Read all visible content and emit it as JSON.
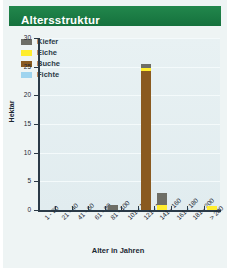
{
  "header": {
    "title": "Altersstruktur"
  },
  "chart_data": {
    "type": "bar",
    "stacked": true,
    "title": "Altersstruktur",
    "xlabel": "Alter in Jahren",
    "ylabel": "Hektar",
    "ylim": [
      0,
      30
    ],
    "yticks": [
      0,
      5,
      10,
      15,
      20,
      25,
      30
    ],
    "grid": true,
    "legend_position": "top-left",
    "categories": [
      "1 - 20",
      "21 - 40",
      "41 - 60",
      "61 - 80",
      "81 - 100",
      "101 - 120",
      "121 - 140",
      "141 - 160",
      "161 - 180",
      "181 - 200",
      "> 200"
    ],
    "series": [
      {
        "name": "Kiefer",
        "color": "#6e6e66",
        "values": [
          0,
          0,
          0,
          0,
          0.9,
          0,
          0.7,
          2.0,
          0,
          0,
          0
        ]
      },
      {
        "name": "Eiche",
        "color": "#ffed2e",
        "values": [
          0,
          0,
          0,
          0,
          0,
          0,
          0.5,
          0.9,
          0,
          0,
          0.7
        ]
      },
      {
        "name": "Buche",
        "color": "#8a5a20",
        "values": [
          0,
          0,
          0,
          0,
          0,
          0,
          24.3,
          0,
          0,
          0,
          0
        ]
      },
      {
        "name": "Fichte",
        "color": "#9fd4ef",
        "values": [
          0,
          0,
          0,
          0,
          0,
          0,
          0,
          0,
          0,
          0,
          0
        ]
      }
    ],
    "totals": [
      0,
      0,
      0,
      0,
      0.9,
      0,
      25.5,
      2.9,
      0,
      0,
      0.7
    ]
  },
  "colors": {
    "brand_green": "#1f8249",
    "plot_bg": "#e4eef1",
    "axis": "#2b3a47"
  }
}
